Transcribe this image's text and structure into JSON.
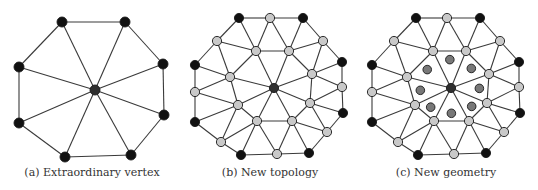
{
  "figure": {
    "panels": [
      {
        "id": "a",
        "caption": "(a) Extraordinary vertex",
        "kind": "original"
      },
      {
        "id": "b",
        "caption": "(b) New topology",
        "kind": "topology"
      },
      {
        "id": "c",
        "caption": "(c) New geometry",
        "kind": "geometry"
      }
    ],
    "legend_colors": {
      "original_vertex": "#111111",
      "extraordinary_vertex": "#2e2e2e",
      "new_vertex": "#c9c9c9",
      "face_point": "#787878",
      "edge": "#3a3a3a"
    },
    "mesh": {
      "valence": 8,
      "original_vertices": 8,
      "new_edge_vertices": 8,
      "new_inner_vertices": 8,
      "face_points": 8
    }
  }
}
